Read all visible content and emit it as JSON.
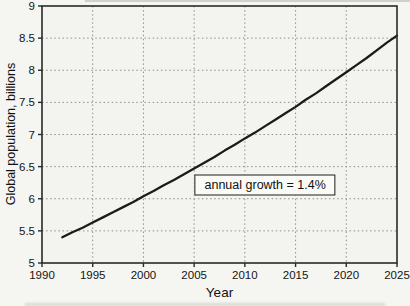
{
  "figure": {
    "background": "#f5f5f1",
    "plot_background": "#f3f3ef",
    "frame_color": "#2a2a2a",
    "grid_color": "#8f8f8f",
    "line_color": "#1b1b1b",
    "text_color": "#141414"
  },
  "chart_data": {
    "type": "line",
    "title": "",
    "xlabel": "Year",
    "ylabel": "Global population, billions",
    "xlim": [
      1990,
      2025
    ],
    "ylim": [
      5,
      9
    ],
    "xticks": [
      1990,
      1995,
      2000,
      2005,
      2010,
      2015,
      2020,
      2025
    ],
    "yticks": [
      5,
      5.5,
      6,
      6.5,
      7,
      7.5,
      8,
      8.5,
      9
    ],
    "grid": true,
    "legend": "none",
    "series": [
      {
        "name": "global-population",
        "x": [
          1992,
          1993,
          1994,
          1995,
          1996,
          1997,
          1998,
          1999,
          2000,
          2001,
          2002,
          2003,
          2004,
          2005,
          2006,
          2007,
          2008,
          2009,
          2010,
          2011,
          2012,
          2013,
          2014,
          2015,
          2016,
          2017,
          2018,
          2019,
          2020,
          2021,
          2022,
          2023,
          2024,
          2025
        ],
        "y": [
          5.4,
          5.48,
          5.55,
          5.63,
          5.71,
          5.79,
          5.87,
          5.95,
          6.04,
          6.12,
          6.21,
          6.29,
          6.38,
          6.47,
          6.56,
          6.65,
          6.75,
          6.84,
          6.94,
          7.03,
          7.13,
          7.23,
          7.33,
          7.43,
          7.54,
          7.64,
          7.75,
          7.86,
          7.97,
          8.08,
          8.19,
          8.31,
          8.43,
          8.54
        ]
      }
    ],
    "annotation": {
      "text": "annual growth = 1.4%",
      "x": 2012,
      "y": 6.22
    }
  }
}
